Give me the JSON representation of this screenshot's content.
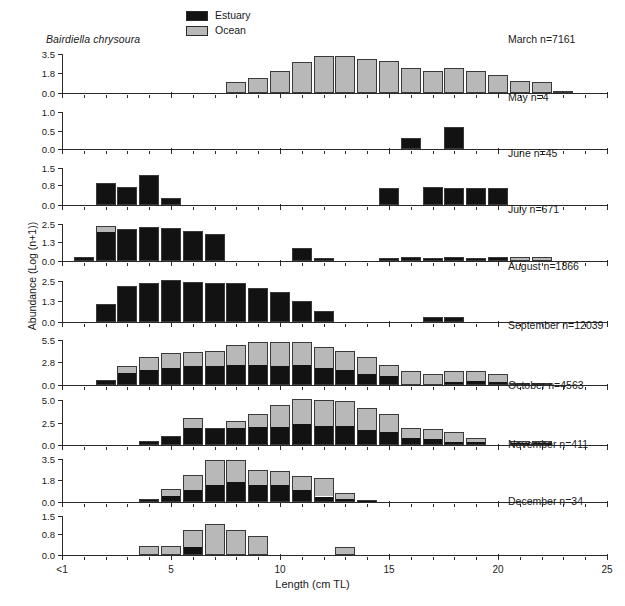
{
  "figure": {
    "species": "Bairdiella chrysoura",
    "ylabel": "Abundance (Log (n+1))",
    "xlabel": "Length (cm TL)"
  },
  "legend": {
    "position": "top-center",
    "items": [
      {
        "label": "Estuary",
        "color": "#121212"
      },
      {
        "label": "Ocean",
        "color": "#b8b8b8"
      }
    ]
  },
  "xaxis": {
    "min": 0,
    "max": 25,
    "major_ticks": [
      0,
      5,
      10,
      15,
      20,
      25
    ],
    "tick_labels": [
      "<1",
      "5",
      "10",
      "15",
      "20",
      "25"
    ],
    "minor_tick_step": 1
  },
  "chart_data": {
    "type": "bar",
    "subtype": "stacked-bar-small-multiples",
    "title": "Bairdiella chrysoura",
    "xlabel": "Length (cm TL)",
    "ylabel": "Abundance (Log (n+1))",
    "xlim": [
      0,
      25
    ],
    "grid": false,
    "legend": [
      "Estuary",
      "Ocean"
    ],
    "series_colors": {
      "Estuary": "#121212",
      "Ocean": "#b8b8b8"
    },
    "panels": [
      {
        "name": "March",
        "label": "March n=7161",
        "n": 7161,
        "ylim": [
          0,
          3.5
        ],
        "yticks": [
          0.0,
          1.8,
          3.5
        ],
        "ytick_labels": [
          "0.0",
          "1.8",
          "3.5"
        ],
        "x": [
          8,
          9,
          10,
          11,
          12,
          13,
          14,
          15,
          16,
          17,
          18,
          19,
          20,
          21,
          22,
          23
        ],
        "estuary": [
          0,
          0,
          0,
          0,
          0,
          0,
          0,
          0,
          0,
          0,
          0,
          0,
          0,
          0,
          0,
          0
        ],
        "ocean": [
          0.95,
          1.35,
          1.95,
          2.75,
          3.35,
          3.3,
          3.05,
          2.85,
          2.25,
          2.0,
          2.25,
          1.95,
          1.65,
          1.1,
          0.95,
          0.18
        ]
      },
      {
        "name": "May",
        "label": "May n=4",
        "n": 4,
        "ylim": [
          0,
          1.0
        ],
        "yticks": [
          0.0,
          0.5,
          1.0
        ],
        "ytick_labels": [
          "0.0",
          "0.5",
          "1.0"
        ],
        "x": [
          16,
          18
        ],
        "estuary": [
          0.3,
          0.6
        ],
        "ocean": [
          0,
          0
        ]
      },
      {
        "name": "June",
        "label": "June n=45",
        "n": 45,
        "ylim": [
          0,
          1.5
        ],
        "yticks": [
          0.0,
          0.8,
          1.5
        ],
        "ytick_labels": [
          "0.0",
          "0.8",
          "1.5"
        ],
        "x": [
          2,
          3,
          4,
          5,
          15,
          17,
          18,
          19,
          20
        ],
        "estuary": [
          0.9,
          0.75,
          1.2,
          0.3,
          0.7,
          0.75,
          0.7,
          0.7,
          0.7
        ],
        "ocean": [
          0,
          0,
          0,
          0,
          0,
          0,
          0,
          0,
          0
        ]
      },
      {
        "name": "July",
        "label": "July n=671",
        "n": 671,
        "ylim": [
          0,
          2.5
        ],
        "yticks": [
          0.0,
          1.3,
          2.5
        ],
        "ytick_labels": [
          "0.0",
          "1.3",
          "2.5"
        ],
        "x": [
          1,
          2,
          3,
          4,
          5,
          6,
          7,
          11,
          12,
          15,
          16,
          17,
          18,
          19,
          20,
          21,
          22
        ],
        "estuary": [
          0.3,
          2.0,
          2.15,
          2.3,
          2.25,
          2.05,
          1.8,
          0.85,
          0.2,
          0.2,
          0.25,
          0.18,
          0.28,
          0.2,
          0.28,
          0.0,
          0.0
        ],
        "ocean": [
          0.0,
          0.35,
          0.0,
          0.0,
          0.0,
          0.0,
          0.0,
          0.0,
          0.0,
          0.0,
          0.0,
          0.0,
          0.0,
          0.0,
          0.0,
          0.28,
          0.28
        ]
      },
      {
        "name": "August",
        "label": "August n=1866",
        "n": 1866,
        "ylim": [
          0,
          2.5
        ],
        "yticks": [
          0.0,
          1.3,
          2.5
        ],
        "ytick_labels": [
          "0.0",
          "1.3",
          "2.5"
        ],
        "x": [
          2,
          3,
          4,
          5,
          6,
          7,
          8,
          9,
          10,
          11,
          12,
          17,
          18
        ],
        "estuary": [
          1.1,
          2.2,
          2.4,
          2.55,
          2.45,
          2.4,
          2.35,
          2.1,
          1.85,
          1.3,
          0.65,
          0.3,
          0.3
        ],
        "ocean": [
          0,
          0,
          0,
          0,
          0,
          0,
          0,
          0,
          0,
          0,
          0,
          0,
          0
        ]
      },
      {
        "name": "September",
        "label": "September n=12039",
        "n": 12039,
        "ylim": [
          0,
          5.5
        ],
        "yticks": [
          0.0,
          2.8,
          5.5
        ],
        "ytick_labels": [
          "0.0",
          "2.8",
          "5.5"
        ],
        "x": [
          2,
          3,
          4,
          5,
          6,
          7,
          8,
          9,
          10,
          11,
          12,
          13,
          14,
          15,
          16,
          17,
          18,
          19,
          20,
          21,
          22
        ],
        "estuary": [
          0.6,
          1.55,
          1.85,
          2.1,
          2.3,
          2.3,
          2.45,
          2.5,
          2.35,
          2.45,
          2.1,
          1.85,
          1.35,
          1.1,
          0.0,
          0.0,
          0.35,
          0.4,
          0.35,
          0.0,
          0.0
        ],
        "ocean": [
          0.0,
          0.8,
          1.6,
          1.8,
          1.7,
          1.8,
          2.5,
          2.7,
          2.85,
          2.75,
          2.5,
          2.35,
          2.1,
          1.4,
          1.7,
          1.35,
          1.35,
          1.3,
          1.05,
          0.25,
          0.2
        ]
      },
      {
        "name": "October",
        "label": "October n=4563",
        "n": 4563,
        "ylim": [
          0,
          5.0
        ],
        "yticks": [
          0.0,
          2.5,
          5.0
        ],
        "ytick_labels": [
          "0.0",
          "2.5",
          "5.0"
        ],
        "x": [
          4,
          5,
          6,
          7,
          8,
          9,
          10,
          11,
          12,
          13,
          14,
          15,
          16,
          17,
          18,
          19,
          21,
          22
        ],
        "estuary": [
          0.45,
          1.05,
          1.9,
          1.9,
          1.95,
          2.05,
          2.0,
          2.3,
          2.05,
          2.05,
          1.65,
          1.45,
          0.75,
          0.7,
          0.25,
          0.3,
          0.15,
          0.15
        ],
        "ocean": [
          0.0,
          0.0,
          1.05,
          0.0,
          0.75,
          1.4,
          2.45,
          2.8,
          3.0,
          2.85,
          2.45,
          1.95,
          1.15,
          1.05,
          1.15,
          0.5,
          0.25,
          0.25
        ]
      },
      {
        "name": "November",
        "label": "November n=411",
        "n": 411,
        "ylim": [
          0,
          3.5
        ],
        "yticks": [
          0.0,
          1.8,
          3.5
        ],
        "ytick_labels": [
          "0.0",
          "1.8",
          "3.5"
        ],
        "x": [
          4,
          5,
          6,
          7,
          8,
          9,
          10,
          11,
          12,
          13,
          14
        ],
        "estuary": [
          0.25,
          0.5,
          0.95,
          1.35,
          1.65,
          1.4,
          1.4,
          0.95,
          0.4,
          0.25,
          0.2
        ],
        "ocean": [
          0.0,
          0.55,
          1.25,
          2.1,
          1.8,
          1.2,
          1.1,
          1.2,
          1.55,
          0.5,
          0.0
        ]
      },
      {
        "name": "December",
        "label": "December n=34",
        "n": 34,
        "ylim": [
          0,
          1.5
        ],
        "yticks": [
          0.0,
          0.8,
          1.5
        ],
        "ytick_labels": [
          "0.0",
          "0.8",
          "1.5"
        ],
        "x": [
          4,
          5,
          6,
          7,
          8,
          9,
          13
        ],
        "estuary": [
          0.0,
          0.0,
          0.3,
          0.0,
          0.0,
          0.0,
          0.0
        ],
        "ocean": [
          0.35,
          0.35,
          0.65,
          1.2,
          0.95,
          0.75,
          0.3
        ]
      }
    ]
  }
}
